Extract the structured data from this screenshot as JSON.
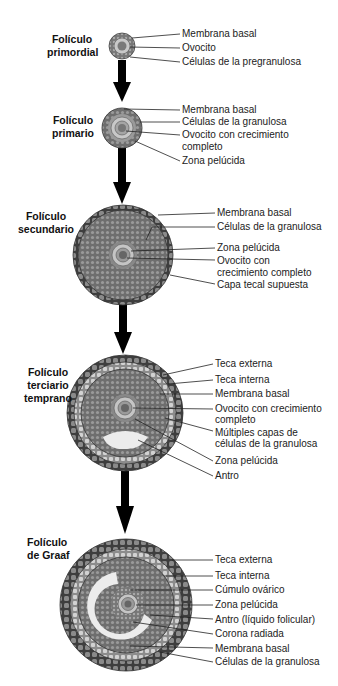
{
  "stages": [
    {
      "title_l1": "Folículo",
      "title_l2": "primordial",
      "labels": [
        "Membrana basal",
        "Ovocito",
        "Células de la pregranulosa"
      ]
    },
    {
      "title_l1": "Folículo",
      "title_l2": "primario",
      "labels": [
        "Membrana basal",
        "Células de la granulosa",
        "Ovocito con crecimiento",
        "completo",
        "Zona pelúcida"
      ]
    },
    {
      "title_l1": "Folículo",
      "title_l2": "secundario",
      "labels": [
        "Membrana basal",
        "Células de la granulosa",
        "Zona pelúcida",
        "Ovocito con",
        "crecimiento completo",
        "Capa tecal supuesta"
      ]
    },
    {
      "title_l1": "Folículo",
      "title_l2": "terciario",
      "title_l3": "temprano",
      "labels": [
        "Teca externa",
        "Teca interna",
        "Membrana basal",
        "Ovocito con crecimiento",
        "completo",
        "Múltiples capas de",
        "células de la granulosa",
        "Zona pelúcida",
        "Antro"
      ]
    },
    {
      "title_l1": "Folículo",
      "title_l2": "de Graaf",
      "labels": [
        "Teca externa",
        "Teca interna",
        "Cúmulo ovárico",
        "Zona pelúcida",
        "Antro (líquido folicular)",
        "Corona radiada",
        "Membrana basal",
        "Células de la granulosa"
      ]
    }
  ],
  "colors": {
    "cell_dark": "#5a5a5a",
    "cell_mid": "#8a8a8a",
    "cell_light": "#c8c8c8",
    "zona": "#b5b5b5",
    "antrum": "#ececec",
    "arrow": "#000000",
    "leader": "#222222"
  }
}
